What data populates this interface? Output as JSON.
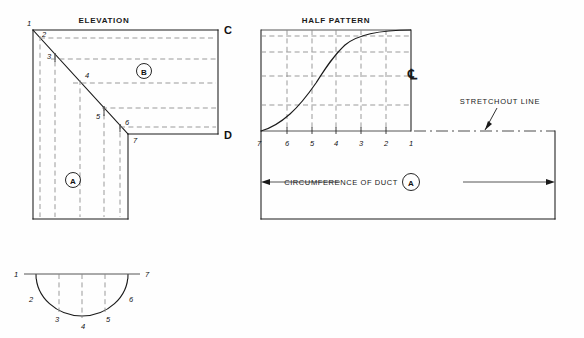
{
  "sheet": {
    "width": 584,
    "height": 338,
    "background": "#fefefe",
    "line_color": "#1a1a1a",
    "hidden_line_color": "#8a8a8a"
  },
  "titles": {
    "elevation": "ELEVATION",
    "half_pattern": "HALF PATTERN"
  },
  "notes": {
    "stretchout_line": "STRETCHOUT  LINE",
    "circumference": "CIRCUMFERENCE OF DUCT"
  },
  "balloons": {
    "a_elevation": "A",
    "b_elevation": "B",
    "a_stretchout": "A"
  },
  "elevation": {
    "corner_labels": [
      {
        "label": "C",
        "x": 224,
        "y": 34
      },
      {
        "label": "D",
        "x": 224,
        "y": 139
      }
    ],
    "station_labels": [
      {
        "label": "1",
        "x": 29,
        "y": 26
      },
      {
        "label": "2",
        "x": 44,
        "y": 37
      },
      {
        "label": "3",
        "x": 49,
        "y": 58
      },
      {
        "label": "4",
        "x": 87,
        "y": 77
      },
      {
        "label": "5",
        "x": 98,
        "y": 118
      },
      {
        "label": "6",
        "x": 127,
        "y": 124
      },
      {
        "label": "7",
        "x": 135,
        "y": 142
      }
    ]
  },
  "half_pattern": {
    "station_labels": [
      "7",
      "6",
      "5",
      "4",
      "3",
      "2",
      "1"
    ],
    "station_x": [
      259,
      287,
      312,
      336,
      361,
      386,
      411
    ],
    "centerline_symbol": "℄"
  },
  "plan": {
    "station_labels": [
      {
        "label": "1",
        "x": 16,
        "y": 275
      },
      {
        "label": "2",
        "x": 31,
        "y": 300
      },
      {
        "label": "3",
        "x": 57,
        "y": 320
      },
      {
        "label": "4",
        "x": 83,
        "y": 326
      },
      {
        "label": "5",
        "x": 108,
        "y": 320
      },
      {
        "label": "6",
        "x": 130,
        "y": 300
      },
      {
        "label": "7",
        "x": 146,
        "y": 275
      }
    ]
  }
}
